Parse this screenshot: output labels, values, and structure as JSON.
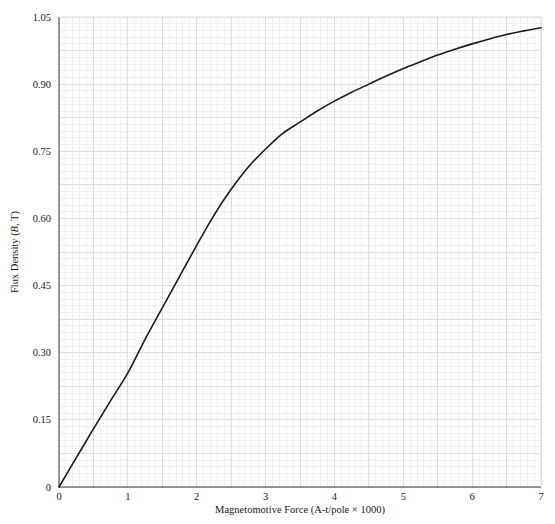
{
  "chart_data": {
    "type": "line",
    "title": "",
    "xlabel": "Magnetomotive Force (A-t/pole × 1000)",
    "ylabel": "Flux Density (B, T)",
    "ylabel_parts": {
      "pre": "Flux Density (",
      "italic": "B",
      "post": ", T)"
    },
    "xlim": [
      0,
      7
    ],
    "ylim": [
      0,
      1.05
    ],
    "grid": true,
    "grid_minor_step_x": 0.1,
    "grid_minor_step_y": 0.015,
    "grid_major_step_x": 0.5,
    "grid_major_step_y": 0.075,
    "legend": "none",
    "xticks": [
      "0",
      "1",
      "2",
      "3",
      "4",
      "5",
      "6",
      "7"
    ],
    "xtick_values": [
      0,
      1,
      2,
      3,
      4,
      5,
      6,
      7
    ],
    "yticks": [
      "0",
      "0.15",
      "0.30",
      "0.45",
      "0.60",
      "0.75",
      "0.90",
      "1.05"
    ],
    "ytick_values": [
      0,
      0.15,
      0.3,
      0.45,
      0.6,
      0.75,
      0.9,
      1.05
    ],
    "series": [
      {
        "name": "Magnetization curve",
        "color": "#1a1a1a",
        "linewidth": 1.6,
        "x": [
          0,
          0.25,
          0.5,
          0.75,
          1.0,
          1.25,
          1.5,
          1.75,
          2.0,
          2.25,
          2.5,
          2.75,
          3.0,
          3.25,
          3.5,
          3.75,
          4.0,
          4.25,
          4.5,
          4.75,
          5.0,
          5.25,
          5.5,
          5.75,
          6.0,
          6.25,
          6.5,
          6.75,
          7.0
        ],
        "y": [
          0.0,
          0.065,
          0.13,
          0.193,
          0.255,
          0.33,
          0.4,
          0.47,
          0.54,
          0.607,
          0.665,
          0.715,
          0.755,
          0.79,
          0.815,
          0.84,
          0.862,
          0.882,
          0.9,
          0.918,
          0.935,
          0.95,
          0.965,
          0.978,
          0.99,
          1.001,
          1.011,
          1.019,
          1.026
        ]
      }
    ]
  },
  "colors": {
    "curve": "#1a1a1a",
    "axis": "#3a3a3a",
    "grid_minor": "#ebebeb",
    "grid_major": "#dcdcdc",
    "text": "#1a1a1a",
    "background": "#ffffff"
  }
}
